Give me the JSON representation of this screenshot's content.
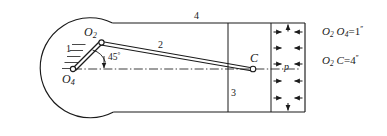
{
  "figure": {
    "stroke_color": "#1a1a1a",
    "background_color": "#ffffff",
    "labels": {
      "pivot_o2": "O",
      "pivot_o2_sub": "2",
      "pivot_o4": "O",
      "pivot_o4_sub": "4",
      "point_c": "C",
      "link_1": "1",
      "link_2": "2",
      "link_3": "3",
      "link_4": "4",
      "angle": "45",
      "angle_unit": "°",
      "pressure": "p"
    },
    "annotations": [
      {
        "name": "crank-length",
        "lhs_main_1": "O",
        "lhs_sub_1": "2",
        "lhs_main_2": "O",
        "lhs_sub_2": "4",
        "equals": "=",
        "value": "1",
        "unit": "′′"
      },
      {
        "name": "coupler-length",
        "lhs_main_1": "O",
        "lhs_sub_1": "2",
        "lhs_main_2": "C",
        "lhs_sub_2": "",
        "equals": "=",
        "value": "4",
        "unit": "′′"
      }
    ],
    "geometry": {
      "cylinder_circle_center": [
        67,
        68
      ],
      "cylinder_circle_radius": 50,
      "cylinder_top_y": 23,
      "cylinder_bottom_y": 112,
      "cylinder_right_x": 305,
      "piston_face_x": 228,
      "chamber_left_x": 271,
      "pivot_o2": [
        101,
        42
      ],
      "pivot_o4": [
        73,
        69
      ],
      "point_c": [
        253,
        69
      ],
      "angle_degrees": 45
    }
  }
}
